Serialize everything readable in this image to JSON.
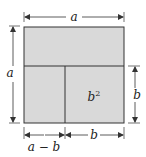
{
  "diagram": {
    "fill_color": "#d9d9d9",
    "line_color": "#333333",
    "labels": {
      "top_width": "a",
      "left_height": "a",
      "right_height": "b",
      "inner_square": "b",
      "inner_square_exp": "2",
      "bottom_left": "a − b",
      "bottom_right": "b"
    }
  }
}
